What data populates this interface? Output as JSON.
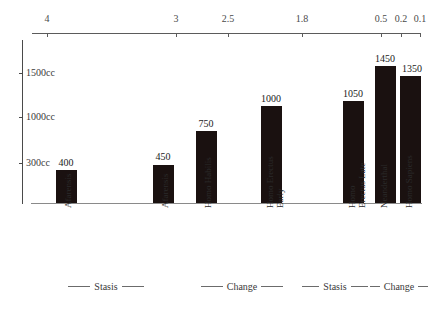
{
  "chart_data": {
    "type": "bar",
    "title": "",
    "subtitle": "",
    "xlabel": "",
    "ylabel": "",
    "categories": [
      "Afarensis",
      "Afarensis",
      "Homo Habilis",
      "Homo Erectus Early",
      "Homo Erectus Late",
      "Neanderthal",
      "Homo Sapiens"
    ],
    "category_lines": [
      [
        "Afarensis"
      ],
      [
        "Afarensis"
      ],
      [
        "Homo Habilis"
      ],
      [
        "Homo Erectus",
        "Early"
      ],
      [
        "Homo",
        "Erectus Late"
      ],
      [
        "Neanderthal"
      ],
      [
        "Homo Sapiens"
      ]
    ],
    "values": [
      400,
      450,
      750,
      1000,
      1050,
      1450,
      1350
    ],
    "value_labels": [
      "400",
      "450",
      "750",
      "1000",
      "1050",
      "1450",
      "1350"
    ],
    "ylim": [
      0,
      1700
    ],
    "ytick_values": [
      300,
      1000,
      1500
    ],
    "ytick_labels": [
      "300cc",
      "1000cc",
      "1500cc"
    ],
    "grid": false,
    "legend": "none",
    "bar_color": "#1a1110",
    "axis_color": "#4a4a4a",
    "top_axis": {
      "label": "",
      "tick_labels": [
        "4",
        "3",
        "2.5",
        "1.8",
        "0.5",
        "0.2",
        "0.1"
      ],
      "tick_values": [
        4,
        3,
        2.5,
        1.8,
        0.5,
        0.2,
        0.1
      ],
      "tick_x": [
        47,
        176,
        228,
        302,
        381,
        401,
        420
      ]
    },
    "phases": [
      {
        "label": "Stasis",
        "from_x": 36,
        "to_x": 176
      },
      {
        "label": "Change",
        "from_x": 184,
        "to_x": 300
      },
      {
        "label": "Stasis",
        "from_x": 302,
        "to_x": 368
      },
      {
        "label": "Change",
        "from_x": 370,
        "to_x": 428
      }
    ],
    "bars_px": [
      {
        "x": 56,
        "w": 21,
        "top": 170
      },
      {
        "x": 153,
        "w": 21,
        "top": 165
      },
      {
        "x": 196,
        "w": 21,
        "top": 131
      },
      {
        "x": 261,
        "w": 21,
        "top": 106
      },
      {
        "x": 343,
        "w": 21,
        "top": 101
      },
      {
        "x": 375,
        "w": 21,
        "top": 66
      },
      {
        "x": 400,
        "w": 21,
        "top": 76
      }
    ],
    "label_px": [
      {
        "x": 66,
        "y": 158
      },
      {
        "x": 163,
        "y": 152
      },
      {
        "x": 206,
        "y": 119
      },
      {
        "x": 271,
        "y": 94
      },
      {
        "x": 353,
        "y": 89
      },
      {
        "x": 385,
        "y": 54
      },
      {
        "x": 412,
        "y": 64
      }
    ],
    "ytick_px": [
      {
        "y": 163,
        "label_index": 0
      },
      {
        "y": 117,
        "label_index": 1
      },
      {
        "y": 73,
        "label_index": 2
      }
    ],
    "cat_label_px": [
      {
        "x": 64,
        "two_line": false
      },
      {
        "x": 161,
        "two_line": false
      },
      {
        "x": 204,
        "two_line": false
      },
      {
        "x": 266,
        "two_line": true
      },
      {
        "x": 348,
        "two_line": true
      },
      {
        "x": 380,
        "two_line": false
      },
      {
        "x": 405,
        "two_line": false
      }
    ]
  }
}
